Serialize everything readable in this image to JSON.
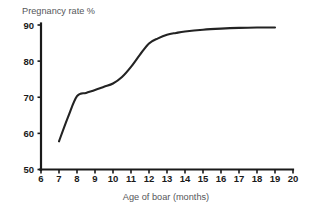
{
  "chart_data": {
    "type": "line",
    "title": "Pregnancy rate %",
    "xlabel": "Age of boar (months)",
    "ylabel": "Pregnancy rate %",
    "x": [
      7,
      7.5,
      8,
      8.5,
      9,
      9.5,
      10,
      10.5,
      11,
      11.5,
      12,
      12.5,
      13,
      13.5,
      14,
      15,
      16,
      17,
      18,
      19
    ],
    "values": [
      57.8,
      64.5,
      70.3,
      71.2,
      72.0,
      72.9,
      73.8,
      75.6,
      78.4,
      81.8,
      84.9,
      86.3,
      87.3,
      87.8,
      88.2,
      88.7,
      89.0,
      89.2,
      89.3,
      89.3
    ],
    "series": [
      {
        "name": "Pregnancy rate %",
        "values": [
          57.8,
          64.5,
          70.3,
          71.2,
          72.0,
          72.9,
          73.8,
          75.6,
          78.4,
          81.8,
          84.9,
          86.3,
          87.3,
          87.8,
          88.2,
          88.7,
          89.0,
          89.2,
          89.3,
          89.3
        ]
      }
    ],
    "xlim": [
      6,
      20
    ],
    "ylim": [
      50,
      90
    ],
    "xticks": [
      6,
      7,
      8,
      9,
      10,
      11,
      12,
      13,
      14,
      15,
      16,
      17,
      18,
      19,
      20
    ],
    "yticks": [
      50,
      60,
      70,
      80,
      90
    ],
    "xtick_labels": [
      "6",
      "7",
      "8",
      "9",
      "10",
      "11",
      "12",
      "13",
      "14",
      "15",
      "16",
      "17",
      "18",
      "19",
      "20"
    ],
    "ytick_labels": [
      "50",
      "60",
      "70",
      "80",
      "90"
    ],
    "grid": false,
    "legend": false,
    "line_color": "#232323",
    "axis_color": "#1a1a1a",
    "label_color": "#55565a",
    "background": "#ffffff"
  }
}
